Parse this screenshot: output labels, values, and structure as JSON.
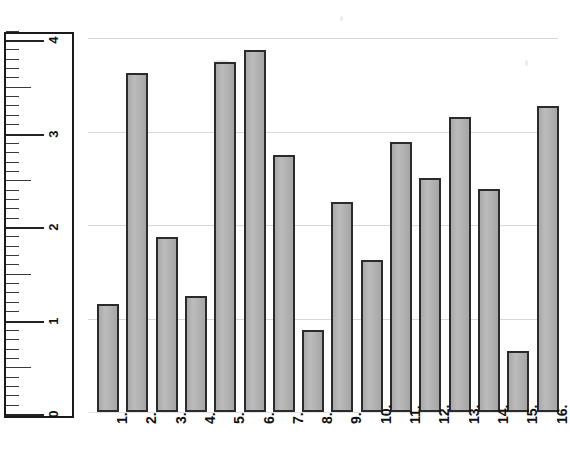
{
  "chart_data": {
    "type": "bar",
    "title": "",
    "subtitle": "",
    "xlabel": "",
    "ylabel": "",
    "categories": [
      "1.",
      "2.",
      "3.",
      "4.",
      "5.",
      "6.",
      "7.",
      "8.",
      "9.",
      "10.",
      "11.",
      "12.",
      "13.",
      "14.",
      "15.",
      "16."
    ],
    "values": [
      1.15,
      3.63,
      1.87,
      1.24,
      3.74,
      3.87,
      2.75,
      0.88,
      2.25,
      1.63,
      2.89,
      2.5,
      3.15,
      2.39,
      0.65,
      3.27
    ],
    "ylim": [
      0,
      4.1
    ],
    "y_tick_labels": [
      "0",
      "1",
      "2",
      "3",
      "4"
    ],
    "y_tick_values": [
      0,
      1,
      2,
      3,
      4
    ],
    "y_minor_step": 0.1,
    "y_half_step": 0.5,
    "grid": "horizontal",
    "legend": "none",
    "bar_fill": "#b3b3b3",
    "bar_stroke": "#2b2b2b",
    "grid_color": "#d8d8d8",
    "axis_color": "#1a1a1a",
    "orientation": "rotated-90"
  }
}
